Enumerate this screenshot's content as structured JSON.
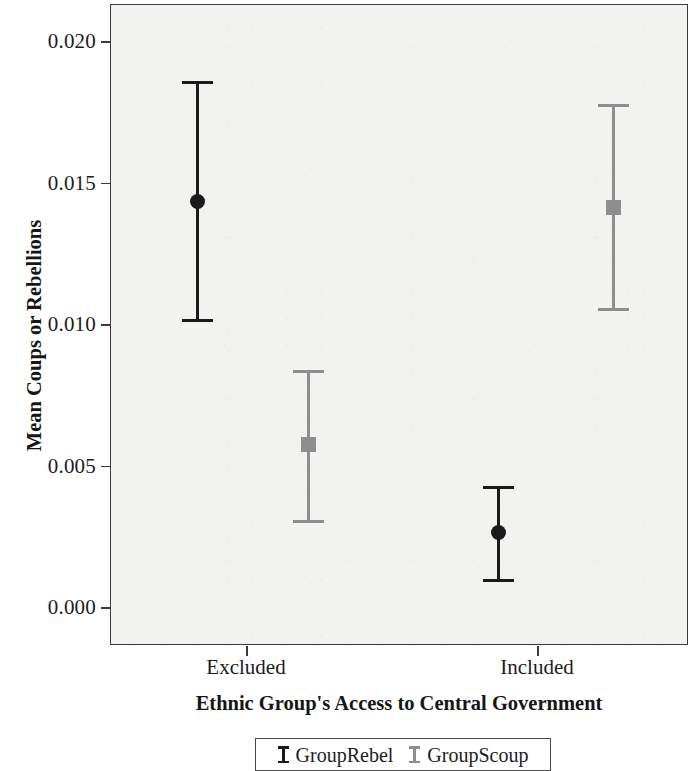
{
  "chart_data": {
    "type": "scatter",
    "title": "",
    "xlabel": "Ethnic Group's Access to Central Government",
    "ylabel": "Mean Coups or Rebellions",
    "categories": [
      "Excluded",
      "Included"
    ],
    "ylim": [
      0.0,
      0.0215
    ],
    "yticks": [
      0.0,
      0.005,
      0.01,
      0.015,
      0.02
    ],
    "ytick_labels": [
      "0.000",
      "0.005",
      "0.010",
      "0.015",
      "0.020"
    ],
    "grid": false,
    "legend_position": "below-axis",
    "series": [
      {
        "name": "GroupRebel",
        "color": "#1a1a1a",
        "marker": "circle",
        "values": [
          0.0144,
          0.0027
        ],
        "ci_low": [
          0.0102,
          0.001
        ],
        "ci_high": [
          0.0186,
          0.0043
        ]
      },
      {
        "name": "GroupScoup",
        "color": "#8e8e8e",
        "marker": "square",
        "values": [
          0.0058,
          0.0142
        ],
        "ci_low": [
          0.0031,
          0.0106
        ],
        "ci_high": [
          0.0084,
          0.0178
        ]
      }
    ],
    "points": [
      {
        "category": "Excluded",
        "series": "GroupRebel",
        "mean": 0.0144,
        "ci_low": 0.0102,
        "ci_high": 0.0186,
        "color": "#1a1a1a",
        "marker": "circle",
        "x_px": 196
      },
      {
        "category": "Excluded",
        "series": "GroupScoup",
        "mean": 0.0058,
        "ci_low": 0.0031,
        "ci_high": 0.0084,
        "color": "#8e8e8e",
        "marker": "square",
        "x_px": 307
      },
      {
        "category": "Included",
        "series": "GroupRebel",
        "mean": 0.0027,
        "ci_low": 0.001,
        "ci_high": 0.0043,
        "color": "#1a1a1a",
        "marker": "circle",
        "x_px": 497
      },
      {
        "category": "Included",
        "series": "GroupScoup",
        "mean": 0.0142,
        "ci_low": 0.0106,
        "ci_high": 0.0178,
        "color": "#8e8e8e",
        "marker": "square",
        "x_px": 612
      }
    ]
  },
  "axes": {
    "y_title": "Mean Coups or Rebellions",
    "x_title": "Ethnic Group's Access to Central Government",
    "y_tick_labels": [
      "0.020",
      "0.015",
      "0.010",
      "0.005",
      "0.000"
    ],
    "x_tick_labels": [
      "Excluded",
      "Included"
    ]
  },
  "legend": {
    "entries": [
      {
        "label": "GroupRebel",
        "color": "#1a1a1a"
      },
      {
        "label": "GroupScoup",
        "color": "#8e8e8e"
      }
    ]
  },
  "colors": {
    "series_rebel": "#1a1a1a",
    "series_scoup": "#8e8e8e",
    "panel_fill": "#f2f2f1",
    "panel_border": "#3a3a3a",
    "text": "#1c1c1c"
  }
}
